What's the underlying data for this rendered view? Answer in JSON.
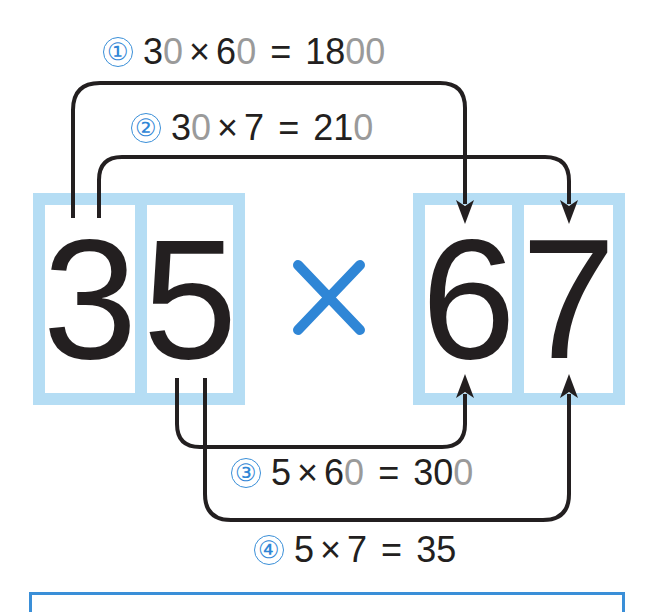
{
  "diagram": {
    "multiplicand": {
      "tens": "3",
      "ones": "5"
    },
    "multiplier": {
      "tens": "6",
      "ones": "7"
    },
    "operator": "×",
    "colors": {
      "box_border": "#b5ddf4",
      "operator": "#2f86d6",
      "badge": "#2f86d6",
      "arrow": "#231f20",
      "placeholder_zero": "#9a9a9a",
      "text": "#231f20"
    },
    "steps": [
      {
        "badge": "①",
        "parts": [
          {
            "text": "3",
            "muted": false
          },
          {
            "text": "0",
            "muted": true
          },
          {
            "text": "×",
            "muted": false,
            "op": true
          },
          {
            "text": "6",
            "muted": false
          },
          {
            "text": "0",
            "muted": true
          },
          {
            "text": "=",
            "muted": false,
            "op": true
          },
          {
            "text": "18",
            "muted": false
          },
          {
            "text": "00",
            "muted": true
          }
        ],
        "plain": "30 × 60 = 1800",
        "from": "3 (tens of 35)",
        "to": "6 (tens of 67)"
      },
      {
        "badge": "②",
        "parts": [
          {
            "text": "3",
            "muted": false
          },
          {
            "text": "0",
            "muted": true
          },
          {
            "text": "×",
            "muted": false,
            "op": true
          },
          {
            "text": "7",
            "muted": false
          },
          {
            "text": "=",
            "muted": false,
            "op": true
          },
          {
            "text": "21",
            "muted": false
          },
          {
            "text": "0",
            "muted": true
          }
        ],
        "plain": "30 × 7 = 210",
        "from": "3 (tens of 35)",
        "to": "7 (ones of 67)"
      },
      {
        "badge": "③",
        "parts": [
          {
            "text": "5",
            "muted": false
          },
          {
            "text": "×",
            "muted": false,
            "op": true
          },
          {
            "text": "6",
            "muted": false
          },
          {
            "text": "0",
            "muted": true
          },
          {
            "text": "=",
            "muted": false,
            "op": true
          },
          {
            "text": "30",
            "muted": false
          },
          {
            "text": "0",
            "muted": true
          }
        ],
        "plain": "5 × 60 = 300",
        "from": "5 (ones of 35)",
        "to": "6 (tens of 67)"
      },
      {
        "badge": "④",
        "parts": [
          {
            "text": "5",
            "muted": false
          },
          {
            "text": "×",
            "muted": false,
            "op": true
          },
          {
            "text": "7",
            "muted": false
          },
          {
            "text": "=",
            "muted": false,
            "op": true
          },
          {
            "text": "35",
            "muted": false
          }
        ],
        "plain": "5 × 7 = 35",
        "from": "5 (ones of 35)",
        "to": "7 (ones of 67)"
      }
    ]
  }
}
